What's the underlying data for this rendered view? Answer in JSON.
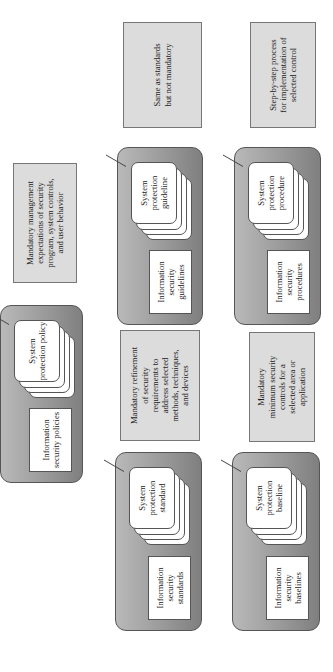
{
  "diagram": {
    "orientation": "rotated-90-ccw",
    "colors": {
      "block_fill": "#9a9a9a",
      "block_border": "#555555",
      "note_fill": "#dcdcdc",
      "note_border": "#777777",
      "card_fill": "#ffffff"
    },
    "policies": {
      "doc_label": "Information security policies",
      "card_label": "System protection policy",
      "note": [
        "Mandatory management",
        "expectations of security",
        "program, system controls,",
        "and user behavior"
      ]
    },
    "standards": {
      "doc_label": "Information security standards",
      "card_label": "System protection standard",
      "note": [
        "Mandatory refinement",
        "of security",
        "requirements to",
        "address selected",
        "methods, techniques,",
        "and devices"
      ]
    },
    "guidelines": {
      "doc_label": "Information security guidelines",
      "card_label": "System protection guideline",
      "note": [
        "Same as standards",
        "but not mandatory"
      ]
    },
    "baselines": {
      "doc_label": "Information security baselines",
      "card_label": "System protection baseline",
      "note": [
        "Mandatory",
        "minimum security",
        "controls for a",
        "selected area or",
        "application"
      ]
    },
    "procedures": {
      "doc_label": "Information security procedures",
      "card_label": "System protection procedure",
      "note": [
        "Step-by-step process",
        "for implementation of",
        "selected control"
      ]
    }
  }
}
